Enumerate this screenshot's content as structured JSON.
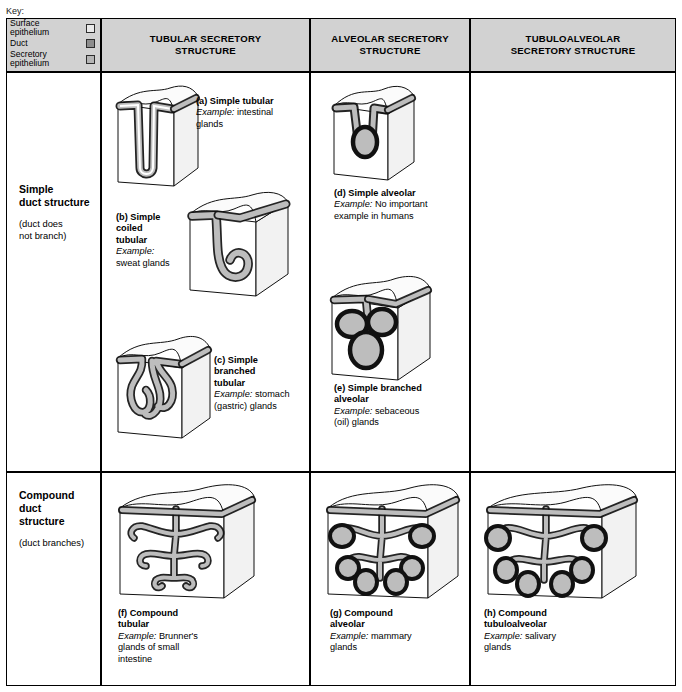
{
  "key": {
    "title": "Key:",
    "items": [
      {
        "label_line1": "Surface",
        "label_line2": "epithelium",
        "swatch": "surface",
        "color": "#e9e9e9"
      },
      {
        "label_line1": "Duct",
        "label_line2": "",
        "swatch": "duct",
        "color": "#8d8d8d"
      },
      {
        "label_line1": "Secretory",
        "label_line2": "epithelium",
        "swatch": "secretory",
        "color": "#b5b5b5"
      }
    ]
  },
  "columns": [
    {
      "id": "tubular",
      "line1": "TUBULAR SECRETORY",
      "line2": "STRUCTURE"
    },
    {
      "id": "alveolar",
      "line1": "ALVEOLAR SECRETORY",
      "line2": "STRUCTURE"
    },
    {
      "id": "tubuloalveolar",
      "line1": "TUBULOALVEOLAR",
      "line2": "SECRETORY STRUCTURE"
    }
  ],
  "rows": [
    {
      "id": "simple",
      "line1": "Simple",
      "line2": "duct structure",
      "sub_line1": "(duct does",
      "sub_line2": "not branch)"
    },
    {
      "id": "compound",
      "line1": "Compound",
      "line2": "duct",
      "line3": "structure",
      "sub_line1": "(duct branches)",
      "sub_line2": ""
    }
  ],
  "figures": {
    "a": {
      "title": "(a) Simple tubular",
      "example_label": "Example:",
      "example_text": "intestinal",
      "example_text2": "glands"
    },
    "b": {
      "title_l1": "(b) Simple",
      "title_l2": "coiled",
      "title_l3": "tubular",
      "example_label": "Example:",
      "example_text": "sweat glands"
    },
    "c": {
      "title_l1": "(c) Simple",
      "title_l2": "branched",
      "title_l3": "tubular",
      "example_label": "Example:",
      "example_text": "stomach",
      "example_text2": "(gastric) glands"
    },
    "d": {
      "title": "(d) Simple alveolar",
      "example_label": "Example:",
      "example_text": "No important",
      "example_text2": "example in humans"
    },
    "e": {
      "title_l1": "(e) Simple branched",
      "title_l2": "alveolar",
      "example_label": "Example:",
      "example_text": "sebaceous",
      "example_text2": "(oil) glands"
    },
    "f": {
      "title_l1": "(f) Compound",
      "title_l2": "tubular",
      "example_label": "Example:",
      "example_text": "Brunner's",
      "example_text2": "glands of  small",
      "example_text3": "intestine"
    },
    "g": {
      "title_l1": "(g) Compound",
      "title_l2": "alveolar",
      "example_label": "Example:",
      "example_text": "mammary",
      "example_text2": "glands"
    },
    "h": {
      "title_l1": "(h) Compound",
      "title_l2": "tubuloalveolar",
      "example_label": "Example:",
      "example_text": "salivary",
      "example_text2": "glands"
    }
  },
  "colors": {
    "header_fill": "#d2d2d2",
    "epithelium_stroke": "#000000",
    "epithelium_fill": "#9a9a9a",
    "cube_face": "#ffffff",
    "cube_top": "#fbfbfb",
    "cube_side": "#f2f2f2"
  }
}
